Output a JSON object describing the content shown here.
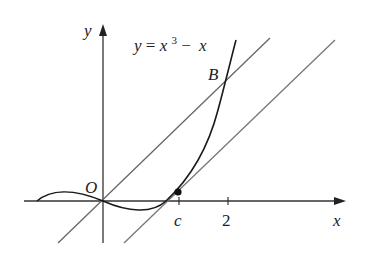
{
  "diagram": {
    "title_equation": {
      "y": "y",
      "equals": " = ",
      "x": "x",
      "exponent": "3",
      "minus": " − ",
      "x2": "x"
    },
    "labels": {
      "y_axis": "y",
      "x_axis": "x",
      "origin": "O",
      "point_b": "B",
      "tick_c": "c",
      "tick_2": "2"
    },
    "elements": {
      "curve": "y = x^3 - x",
      "secant_line": "line through O and B (slope 3)",
      "tangent_line": "tangent at x = c parallel to secant",
      "tangent_point": "point on curve at x = c"
    },
    "colors": {
      "axis": "#333333",
      "curve": "#1a1a1a",
      "lines": "#666666",
      "text": "#222222"
    }
  }
}
